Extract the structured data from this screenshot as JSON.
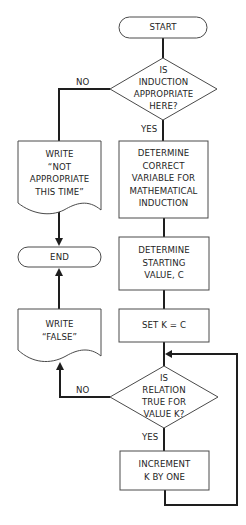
{
  "diagram": {
    "type": "flowchart",
    "colors": {
      "line": "#1e1e1e",
      "shape_stroke": "#4a4a4a",
      "background": "#ffffff"
    },
    "nodes": {
      "start": {
        "shape": "terminal",
        "lines": [
          "START"
        ]
      },
      "induction_decision": {
        "shape": "decision",
        "lines": [
          "IS",
          "INDUCTION",
          "APPROPRIATE",
          "HERE?"
        ]
      },
      "write_not_appropriate": {
        "shape": "document",
        "lines": [
          "WRITE",
          "“NOT",
          "APPROPRIATE",
          "THIS TIME”"
        ]
      },
      "determine_variable": {
        "shape": "process",
        "lines": [
          "DETERMINE",
          "CORRECT",
          "VARIABLE FOR",
          "MATHEMATICAL",
          "INDUCTION"
        ]
      },
      "end": {
        "shape": "terminal",
        "lines": [
          "END"
        ]
      },
      "determine_starting": {
        "shape": "process",
        "lines": [
          "DETERMINE",
          "STARTING",
          "VALUE, C"
        ]
      },
      "write_false": {
        "shape": "document",
        "lines": [
          "WRITE",
          "“FALSE”"
        ]
      },
      "set_k": {
        "shape": "process",
        "lines": [
          "SET K = C"
        ]
      },
      "relation_decision": {
        "shape": "decision",
        "lines": [
          "IS",
          "RELATION",
          "TRUE FOR",
          "VALUE K?"
        ]
      },
      "increment_k": {
        "shape": "process",
        "lines": [
          "INCREMENT",
          "K BY ONE"
        ]
      }
    },
    "edges": {
      "induction_no": "NO",
      "induction_yes": "YES",
      "relation_no": "NO",
      "relation_yes": "YES"
    },
    "connections": [
      [
        "start",
        "induction_decision"
      ],
      [
        "induction_decision",
        "write_not_appropriate",
        "NO"
      ],
      [
        "induction_decision",
        "determine_variable",
        "YES"
      ],
      [
        "write_not_appropriate",
        "end"
      ],
      [
        "determine_variable",
        "determine_starting"
      ],
      [
        "determine_starting",
        "set_k"
      ],
      [
        "set_k",
        "relation_decision"
      ],
      [
        "relation_decision",
        "write_false",
        "NO"
      ],
      [
        "write_false",
        "end"
      ],
      [
        "relation_decision",
        "increment_k",
        "YES"
      ],
      [
        "increment_k",
        "relation_decision"
      ]
    ]
  }
}
